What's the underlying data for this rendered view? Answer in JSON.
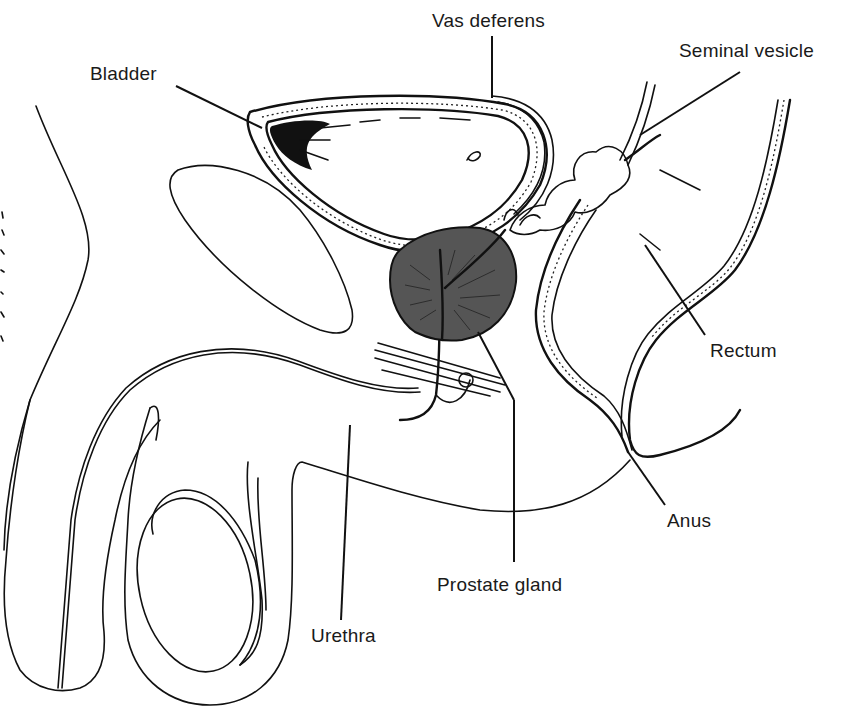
{
  "diagram": {
    "type": "anatomical-cross-section",
    "labels": {
      "vas_deferens": "Vas deferens",
      "seminal_vesicle": "Seminal vesicle",
      "bladder": "Bladder",
      "rectum": "Rectum",
      "anus": "Anus",
      "prostate_gland": "Prostate gland",
      "urethra": "Urethra"
    },
    "colors": {
      "ink": "#111111",
      "prostate_fill": "#555555",
      "background": "#ffffff"
    }
  }
}
